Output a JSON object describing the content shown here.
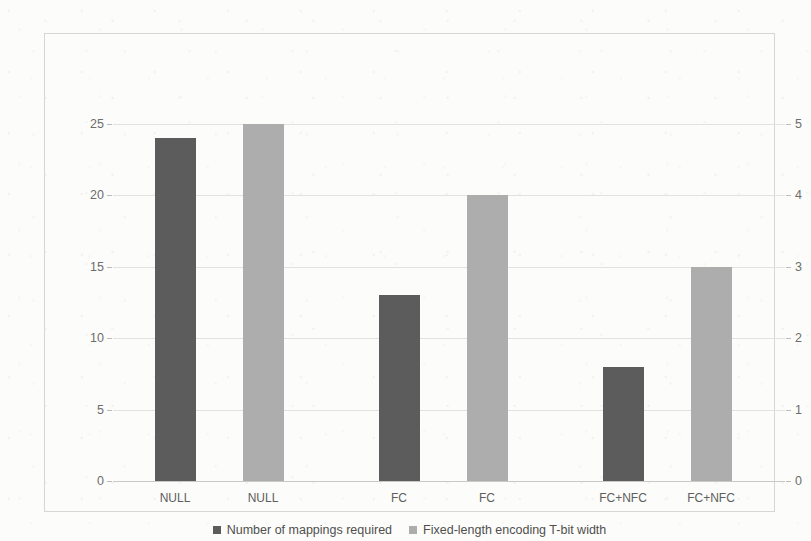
{
  "chart_data": {
    "type": "bar",
    "title": "",
    "xlabel": "",
    "ylabel": "",
    "grid": true,
    "legend_position": "bottom",
    "categories": [
      "NULL",
      "NULL",
      "FC",
      "FC",
      "FC+NFC",
      "FC+NFC"
    ],
    "series": [
      {
        "name": "Number of mappings required",
        "color": "#5c5c5c",
        "axis": "left",
        "values": [
          24,
          null,
          13,
          null,
          8,
          null
        ]
      },
      {
        "name": "Fixed-length encoding T-bit width",
        "color": "#adadad",
        "axis": "right",
        "values": [
          null,
          5,
          null,
          4,
          null,
          3
        ]
      }
    ],
    "bars": [
      {
        "category": "NULL",
        "series": "Number of mappings required",
        "value": 24,
        "axis": "left",
        "color": "#5c5c5c"
      },
      {
        "category": "NULL",
        "series": "Fixed-length encoding T-bit width",
        "value": 5,
        "axis": "right",
        "color": "#adadad"
      },
      {
        "category": "FC",
        "series": "Number of mappings required",
        "value": 13,
        "axis": "left",
        "color": "#5c5c5c"
      },
      {
        "category": "FC",
        "series": "Fixed-length encoding T-bit width",
        "value": 4,
        "axis": "right",
        "color": "#adadad"
      },
      {
        "category": "FC+NFC",
        "series": "Number of mappings required",
        "value": 8,
        "axis": "left",
        "color": "#5c5c5c"
      },
      {
        "category": "FC+NFC",
        "series": "Fixed-length encoding T-bit width",
        "value": 3,
        "axis": "right",
        "color": "#adadad"
      }
    ],
    "left_axis": {
      "ylim": [
        0,
        25
      ],
      "ticks": [
        0,
        5,
        10,
        15,
        20,
        25
      ],
      "tick_labels": [
        "0",
        "5",
        "10",
        "15",
        "20",
        "25"
      ]
    },
    "right_axis": {
      "ylim": [
        0,
        5
      ],
      "ticks": [
        0,
        1,
        2,
        3,
        4,
        5
      ],
      "tick_labels": [
        "0",
        "1",
        "2",
        "3",
        "4",
        "5"
      ]
    }
  },
  "legend": {
    "entries": [
      {
        "label": "Number of mappings required"
      },
      {
        "label": "Fixed-length encoding T-bit width"
      }
    ]
  },
  "colors": {
    "series_a": "#5c5c5c",
    "series_b": "#adadad",
    "gridline": "#e2e2e0",
    "frame": "#d6d6d4",
    "axis_text": "#6d6d6b",
    "background": "#fcfcfb"
  }
}
